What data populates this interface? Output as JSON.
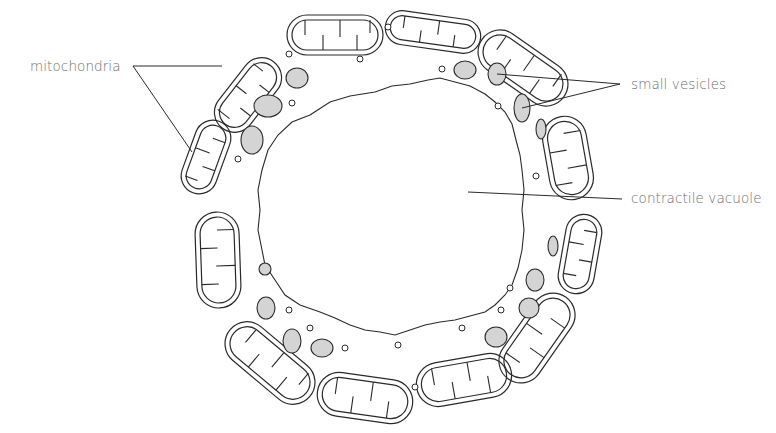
{
  "figure": {
    "type": "biological illustration",
    "labels": [
      {
        "id": "mitochondria",
        "text": "mitochondria",
        "x": 30,
        "y": 58
      },
      {
        "id": "small_vesicles",
        "text": "small vesicles",
        "x": 631,
        "y": 73
      },
      {
        "id": "contractile_vacuole",
        "text": "contractile vacuole",
        "x": 631,
        "y": 219
      }
    ],
    "colors": {
      "background": "#ffffff",
      "line": "#2a2a2a",
      "vesicle_fill": "#d4d4d4",
      "label_text": "#6e6e6e"
    }
  }
}
